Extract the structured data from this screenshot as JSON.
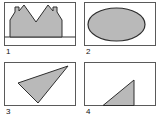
{
  "figure": {
    "background_color": "#ffffff",
    "box_border_color": "#5a5a5a",
    "box_fill_color": "#ffffff",
    "shape_fill_color": "#b9b9b9",
    "shape_stroke_color": "#2e2e2e",
    "label_color": "#111111",
    "panel_size": {
      "w": 72,
      "h": 44
    },
    "panels": [
      {
        "label": "1",
        "shape": "castellated-double-peak",
        "geometry": {
          "type": "polygon",
          "baseline_y": 35,
          "points": [
            [
              6,
              35
            ],
            [
              6,
              18
            ],
            [
              11,
              10
            ],
            [
              11,
              5
            ],
            [
              15,
              5
            ],
            [
              15,
              9
            ],
            [
              20,
              3
            ],
            [
              32,
              20
            ],
            [
              44,
              3
            ],
            [
              49,
              9
            ],
            [
              49,
              5
            ],
            [
              53,
              5
            ],
            [
              53,
              10
            ],
            [
              58,
              18
            ],
            [
              58,
              35
            ]
          ]
        }
      },
      {
        "label": "2",
        "shape": "ellipse",
        "geometry": {
          "type": "ellipse",
          "cx": 32.5,
          "cy": 22.5,
          "rx": 28.5,
          "ry": 16.5
        }
      },
      {
        "label": "3",
        "shape": "scalene-triangle",
        "geometry": {
          "type": "polygon",
          "points": [
            [
              64,
              4
            ],
            [
              14,
              21
            ],
            [
              34,
              41
            ]
          ]
        }
      },
      {
        "label": "4",
        "shape": "right-triangle",
        "geometry": {
          "type": "polygon",
          "points": [
            [
              19,
              43.5
            ],
            [
              50,
              18
            ],
            [
              50,
              43.5
            ]
          ]
        }
      }
    ]
  }
}
